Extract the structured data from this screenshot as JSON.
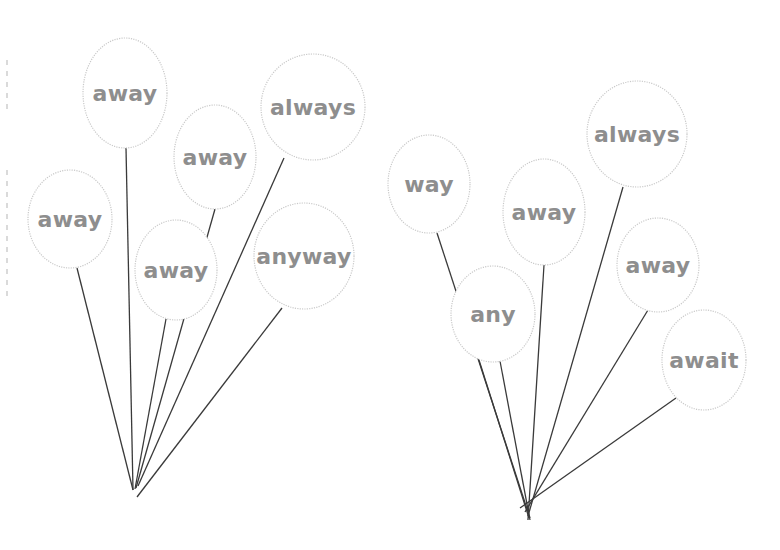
{
  "colors": {
    "background": "#ffffff",
    "string": "#3a3a3a",
    "balloon_outline": "#c9c9c9",
    "label_text": "#8e8e8e"
  },
  "groups": [
    {
      "name": "left-bunch",
      "knot": {
        "x": 133,
        "y": 490
      },
      "balloons": [
        {
          "word": "away",
          "cx": 125,
          "cy": 93,
          "rx": 42,
          "ry": 55,
          "tail": {
            "x": 126,
            "y": 148
          },
          "end": {
            "x": 133,
            "y": 490
          }
        },
        {
          "word": "always",
          "cx": 313,
          "cy": 107,
          "rx": 52,
          "ry": 53,
          "tail": {
            "x": 284,
            "y": 158
          },
          "end": {
            "x": 138,
            "y": 486
          }
        },
        {
          "word": "away",
          "cx": 215,
          "cy": 157,
          "rx": 41,
          "ry": 52,
          "tail": {
            "x": 215,
            "y": 209
          },
          "end": {
            "x": 136,
            "y": 488
          }
        },
        {
          "word": "away",
          "cx": 70,
          "cy": 219,
          "rx": 42,
          "ry": 49,
          "tail": {
            "x": 77,
            "y": 268
          },
          "end": {
            "x": 133,
            "y": 490
          }
        },
        {
          "word": "away",
          "cx": 176,
          "cy": 270,
          "rx": 41,
          "ry": 50,
          "tail": {
            "x": 166,
            "y": 319
          },
          "end": {
            "x": 135,
            "y": 489
          }
        },
        {
          "word": "anyway",
          "cx": 304,
          "cy": 256,
          "rx": 50,
          "ry": 53,
          "tail": {
            "x": 282,
            "y": 308
          },
          "end": {
            "x": 137,
            "y": 497
          }
        }
      ]
    },
    {
      "name": "right-bunch",
      "knot": {
        "x": 528,
        "y": 515
      },
      "balloons": [
        {
          "word": "way",
          "cx": 429,
          "cy": 184,
          "rx": 41,
          "ry": 49,
          "tail": {
            "x": 437,
            "y": 233
          },
          "end": {
            "x": 530,
            "y": 518
          }
        },
        {
          "word": "away",
          "cx": 544,
          "cy": 212,
          "rx": 41,
          "ry": 53,
          "tail": {
            "x": 544,
            "y": 265
          },
          "end": {
            "x": 528,
            "y": 520
          }
        },
        {
          "word": "always",
          "cx": 637,
          "cy": 134,
          "rx": 50,
          "ry": 53,
          "tail": {
            "x": 623,
            "y": 187
          },
          "end": {
            "x": 528,
            "y": 516
          }
        },
        {
          "word": "away",
          "cx": 658,
          "cy": 265,
          "rx": 41,
          "ry": 47,
          "tail": {
            "x": 648,
            "y": 310
          },
          "end": {
            "x": 525,
            "y": 512
          }
        },
        {
          "word": "any",
          "cx": 493,
          "cy": 314,
          "rx": 42,
          "ry": 48,
          "tail": {
            "x": 479,
            "y": 360
          },
          "end": {
            "x": 529,
            "y": 518
          }
        },
        {
          "word": "any",
          "cx": 493,
          "cy": 314,
          "rx": 42,
          "ry": 48,
          "tail": {
            "x": 500,
            "y": 361
          },
          "end": {
            "x": 530,
            "y": 520
          }
        },
        {
          "word": "await",
          "cx": 704,
          "cy": 360,
          "rx": 42,
          "ry": 50,
          "tail": {
            "x": 676,
            "y": 398
          },
          "end": {
            "x": 520,
            "y": 508
          }
        }
      ]
    }
  ],
  "margin_line": {
    "x": 7,
    "segments": [
      [
        60,
        110
      ],
      [
        170,
        300
      ]
    ]
  }
}
